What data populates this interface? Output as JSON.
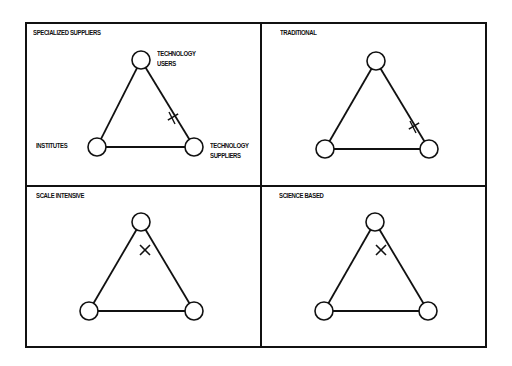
{
  "panels": [
    {
      "title": "SPECIALIZED SUPPLIERS",
      "title_pos": [
        33,
        31
      ],
      "nodes": {
        "top": [
          141,
          60
        ],
        "left": [
          97,
          147
        ],
        "right": [
          194,
          147
        ]
      },
      "marker": {
        "type": "star-cross",
        "pos": [
          173,
          117
        ]
      },
      "labels": {
        "top": "TECHNOLOGY\nUSERS",
        "left": "INSTITUTES",
        "right": "TECHNOLOGY\nSUPPLIERS"
      }
    },
    {
      "title": "TRADITIONAL",
      "title_pos": [
        280,
        31
      ],
      "nodes": {
        "top": [
          376,
          61
        ],
        "left": [
          325,
          149
        ],
        "right": [
          429,
          149
        ]
      },
      "marker": {
        "type": "star-cross",
        "pos": [
          414,
          126
        ]
      }
    },
    {
      "title": "SCALE INTENSIVE",
      "title_pos": [
        36,
        194
      ],
      "nodes": {
        "top": [
          141,
          222
        ],
        "left": [
          89,
          311
        ],
        "right": [
          194,
          311
        ]
      },
      "marker": {
        "type": "x",
        "pos": [
          145,
          250
        ]
      }
    },
    {
      "title": "SCIENCE BASED",
      "title_pos": [
        279,
        194
      ],
      "nodes": {
        "top": [
          375,
          222
        ],
        "left": [
          324,
          311
        ],
        "right": [
          428,
          311
        ]
      },
      "marker": {
        "type": "x",
        "pos": [
          381,
          250
        ]
      }
    }
  ],
  "labels": {
    "panel1_title": "SPECIALIZED SUPPLIERS",
    "panel2_title": "TRADITIONAL",
    "panel3_title": "SCALE INTENSIVE",
    "panel4_title": "SCIENCE BASED",
    "technology_users_line1": "TECHNOLOGY",
    "technology_users_line2": "USERS",
    "institutes": "INSTITUTES",
    "technology_suppliers_line1": "TECHNOLOGY",
    "technology_suppliers_line2": "SUPPLIERS"
  },
  "style": {
    "stroke": "#111111",
    "node_radius": 9,
    "background": "#ffffff"
  }
}
